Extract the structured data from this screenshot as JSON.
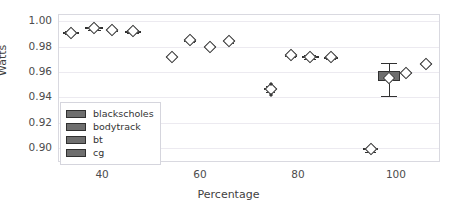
{
  "chart_data": {
    "type": "box",
    "title": "",
    "xlabel": "Percentage",
    "ylabel": "Watts",
    "xlim": [
      31,
      109
    ],
    "ylim": [
      0.888,
      1.005
    ],
    "xticks": [
      "40",
      "60",
      "80",
      "100"
    ],
    "xtick_values": [
      40,
      60,
      80,
      100
    ],
    "yticks": [
      "0.90",
      "0.92",
      "0.94",
      "0.96",
      "0.98",
      "1.00"
    ],
    "ytick_values": [
      0.9,
      0.92,
      0.94,
      0.96,
      0.98,
      1.0
    ],
    "grid": "horizontal",
    "legend_position": "center-left",
    "legend": [
      "blackscholes",
      "bodytrack",
      "bt",
      "cg"
    ],
    "colors": {
      "box_fill": "#6e6e6e",
      "box_edge": "#303030",
      "median_marker": "#ffffff",
      "grid": "#eceaf0",
      "frame": "#d9d9e0",
      "text": "#4c4c4c"
    },
    "boxes": [
      {
        "series": "blackscholes",
        "x": 33.4,
        "width": 3.2,
        "q1": 0.9905,
        "q3": 0.9918,
        "median": 0.991,
        "whisker_low": 0.9898,
        "whisker_high": 0.9925,
        "fliers": []
      },
      {
        "series": "bodytrack",
        "x": 38.2,
        "width": 3.6,
        "q1": 0.9938,
        "q3": 0.9952,
        "median": 0.9945,
        "whisker_low": 0.993,
        "whisker_high": 0.9958,
        "fliers": []
      },
      {
        "series": "bt",
        "x": 41.9,
        "width": 2.4,
        "q1": 0.9928,
        "q3": 0.9934,
        "median": 0.9931,
        "whisker_low": 0.9924,
        "whisker_high": 0.9938,
        "fliers": []
      },
      {
        "series": "cg",
        "x": 46.1,
        "width": 3.4,
        "q1": 0.9914,
        "q3": 0.9926,
        "median": 0.992,
        "whisker_low": 0.9905,
        "whisker_high": 0.9932,
        "fliers": []
      },
      {
        "series": "blackscholes",
        "x": 54.0,
        "width": 2.2,
        "q1": 0.9718,
        "q3": 0.9724,
        "median": 0.9721,
        "whisker_low": 0.9712,
        "whisker_high": 0.973,
        "fliers": []
      },
      {
        "series": "bodytrack",
        "x": 57.8,
        "width": 2.4,
        "q1": 0.9846,
        "q3": 0.9854,
        "median": 0.985,
        "whisker_low": 0.9838,
        "whisker_high": 0.9861,
        "fliers": []
      },
      {
        "series": "bt",
        "x": 61.9,
        "width": 2.2,
        "q1": 0.9797,
        "q3": 0.9804,
        "median": 0.98,
        "whisker_low": 0.979,
        "whisker_high": 0.981,
        "fliers": []
      },
      {
        "series": "cg",
        "x": 65.8,
        "width": 2.4,
        "q1": 0.984,
        "q3": 0.9849,
        "median": 0.9845,
        "whisker_low": 0.9832,
        "whisker_high": 0.9856,
        "fliers": []
      },
      {
        "series": "blackscholes",
        "x": 74.2,
        "width": 2.6,
        "q1": 0.9458,
        "q3": 0.947,
        "median": 0.9464,
        "whisker_low": 0.944,
        "whisker_high": 0.9488,
        "fliers": [
          0.9418,
          0.9508
        ]
      },
      {
        "series": "bodytrack",
        "x": 78.4,
        "width": 2.6,
        "q1": 0.9728,
        "q3": 0.9738,
        "median": 0.9733,
        "whisker_low": 0.9718,
        "whisker_high": 0.9752,
        "fliers": []
      },
      {
        "series": "bt",
        "x": 82.3,
        "width": 3.4,
        "q1": 0.9716,
        "q3": 0.9728,
        "median": 0.9722,
        "whisker_low": 0.9706,
        "whisker_high": 0.9736,
        "fliers": []
      },
      {
        "series": "cg",
        "x": 86.6,
        "width": 2.8,
        "q1": 0.9714,
        "q3": 0.9722,
        "median": 0.9718,
        "whisker_low": 0.9706,
        "whisker_high": 0.973,
        "fliers": []
      },
      {
        "series": "blackscholes",
        "x": 94.6,
        "width": 3.0,
        "q1": 0.8984,
        "q3": 0.8996,
        "median": 0.899,
        "whisker_low": 0.8968,
        "whisker_high": 0.9002,
        "fliers": []
      },
      {
        "series": "bodytrack",
        "x": 98.4,
        "width": 4.4,
        "q1": 0.953,
        "q3": 0.9606,
        "median": 0.9556,
        "whisker_low": 0.9412,
        "whisker_high": 0.9672,
        "fliers": []
      },
      {
        "series": "bt",
        "x": 101.9,
        "width": 2.2,
        "q1": 0.9584,
        "q3": 0.9596,
        "median": 0.959,
        "whisker_low": 0.9576,
        "whisker_high": 0.9604,
        "fliers": []
      },
      {
        "series": "cg",
        "x": 105.9,
        "width": 2.6,
        "q1": 0.966,
        "q3": 0.967,
        "median": 0.9665,
        "whisker_low": 0.9652,
        "whisker_high": 0.9678,
        "fliers": []
      }
    ]
  }
}
